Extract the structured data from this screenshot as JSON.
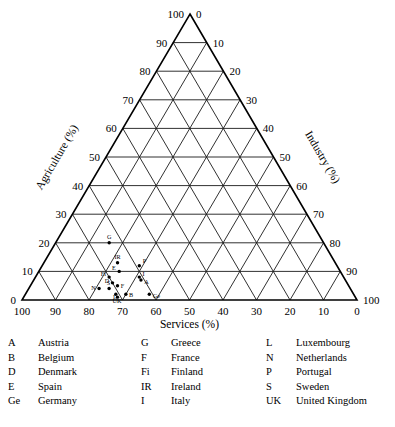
{
  "chart_data": {
    "type": "scatter",
    "plot_kind": "ternary",
    "title": "",
    "axes": {
      "bottom": {
        "label": "Services (%)",
        "ticks": [
          100,
          90,
          80,
          70,
          60,
          50,
          40,
          30,
          20,
          10,
          0
        ],
        "range": [
          0,
          100
        ],
        "direction": "right-to-left"
      },
      "left": {
        "label": "Agriculture (%)",
        "ticks": [
          0,
          10,
          20,
          30,
          40,
          50,
          60,
          70,
          80,
          90,
          100
        ],
        "range": [
          0,
          100
        ],
        "direction": "bottom-to-top"
      },
      "right": {
        "label": "Industry (%)",
        "ticks": [
          0,
          10,
          20,
          30,
          40,
          50,
          60,
          70,
          80,
          90,
          100
        ],
        "range": [
          0,
          100
        ],
        "direction": "top-to-bottom"
      }
    },
    "grid": true,
    "grid_step": 10,
    "legend_position": "below-plot",
    "series": [
      {
        "name": "European countries",
        "points": [
          {
            "code": "G",
            "name": "Greece",
            "services": 64,
            "agriculture": 20,
            "industry": 16
          },
          {
            "code": "IR",
            "name": "Ireland",
            "services": 65,
            "agriculture": 13,
            "industry": 22
          },
          {
            "code": "P",
            "name": "Portugal",
            "services": 59,
            "agriculture": 12,
            "industry": 29
          },
          {
            "code": "E",
            "name": "Spain",
            "services": 66,
            "agriculture": 10,
            "industry": 24
          },
          {
            "code": "I",
            "name": "Italy",
            "services": 61,
            "agriculture": 8,
            "industry": 31
          },
          {
            "code": "A",
            "name": "Austria",
            "services": 61,
            "agriculture": 7,
            "industry": 32
          },
          {
            "code": "Fi",
            "name": "Finland",
            "services": 70,
            "agriculture": 8,
            "industry": 22
          },
          {
            "code": "D",
            "name": "Denmark",
            "services": 70,
            "agriculture": 6,
            "industry": 24
          },
          {
            "code": "F",
            "name": "France",
            "services": 69,
            "agriculture": 5,
            "industry": 26
          },
          {
            "code": "S",
            "name": "Sweden",
            "services": 72,
            "agriculture": 4,
            "industry": 24
          },
          {
            "code": "N",
            "name": "Netherlands",
            "services": 75,
            "agriculture": 4,
            "industry": 21
          },
          {
            "code": "L",
            "name": "Luxembourg",
            "services": 71,
            "agriculture": 2,
            "industry": 27
          },
          {
            "code": "B",
            "name": "Belgium",
            "services": 68,
            "agriculture": 2,
            "industry": 30
          },
          {
            "code": "Ge",
            "name": "Germany",
            "services": 61,
            "agriculture": 2,
            "industry": 37
          },
          {
            "code": "UK",
            "name": "United Kingdom",
            "services": 71,
            "agriculture": 1,
            "industry": 28
          }
        ]
      }
    ]
  },
  "legend": {
    "columns": [
      {
        "entries": [
          {
            "code": "A",
            "name": "Austria"
          },
          {
            "code": "B",
            "name": "Belgium"
          },
          {
            "code": "D",
            "name": "Denmark"
          },
          {
            "code": "E",
            "name": "Spain"
          },
          {
            "code": "Ge",
            "name": "Germany"
          }
        ]
      },
      {
        "entries": [
          {
            "code": "G",
            "name": "Greece"
          },
          {
            "code": "F",
            "name": "France"
          },
          {
            "code": "Fi",
            "name": "Finland"
          },
          {
            "code": "IR",
            "name": "Ireland"
          },
          {
            "code": "I",
            "name": "Italy"
          }
        ]
      },
      {
        "entries": [
          {
            "code": "L",
            "name": "Luxembourg"
          },
          {
            "code": "N",
            "name": "Netherlands"
          },
          {
            "code": "P",
            "name": "Portugal"
          },
          {
            "code": "S",
            "name": "Sweden"
          },
          {
            "code": "UK",
            "name": "United Kingdom"
          }
        ]
      }
    ]
  },
  "colors": {
    "line": "#1a1a1a",
    "outline": "#000000",
    "point": "#000000",
    "background": "#ffffff"
  }
}
